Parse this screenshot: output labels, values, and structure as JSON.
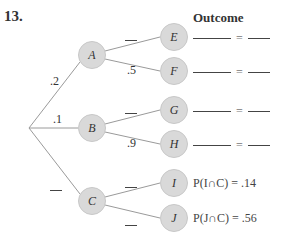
{
  "problem_number": "13.",
  "outcome_header": "Outcome",
  "nodes": {
    "A": "A",
    "B": "B",
    "C": "C",
    "E": "E",
    "F": "F",
    "G": "G",
    "H": "H",
    "I": "I",
    "J": "J"
  },
  "branch_probabilities": {
    "root_A": ".2",
    "root_B": ".1",
    "root_C": "",
    "A_E": "",
    "A_F": ".5",
    "B_G": "",
    "B_H": ".9",
    "C_I": "",
    "C_J": ""
  },
  "outcomes": [
    {
      "node": "E",
      "event": "",
      "value": ""
    },
    {
      "node": "F",
      "event": "",
      "value": ""
    },
    {
      "node": "G",
      "event": "",
      "value": ""
    },
    {
      "node": "H",
      "event": "",
      "value": ""
    },
    {
      "node": "I",
      "event": "P(I ∩ C)",
      "value": ".14",
      "text": "P(I∩C)  = .14"
    },
    {
      "node": "J",
      "event": "P(J ∩ C)",
      "value": ".56",
      "text": "P(J∩C)  = .56"
    }
  ],
  "equals_sign": "="
}
